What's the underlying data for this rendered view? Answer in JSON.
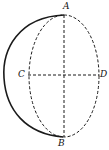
{
  "diagram": {
    "type": "hemisphere-geometry",
    "labels": {
      "A": "A",
      "B": "B",
      "C": "C",
      "D": "D"
    },
    "colors": {
      "stroke": "#1a1a1a",
      "background": "#ffffff"
    }
  }
}
